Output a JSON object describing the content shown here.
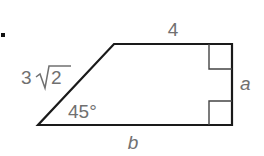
{
  "figure": {
    "marker": "•",
    "shape": "right trapezoid",
    "labels": {
      "top": "4",
      "slant_coef": "3",
      "slant_radical": "2",
      "angle": "45°",
      "right": "a",
      "bottom": "b"
    },
    "colors": {
      "stroke": "#1a1a1a",
      "label": "#707070"
    }
  }
}
